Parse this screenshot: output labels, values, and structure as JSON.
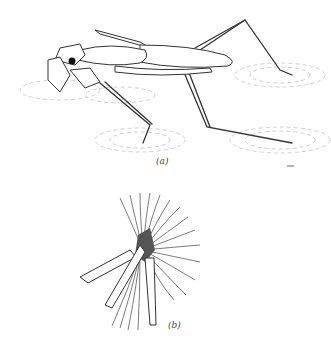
{
  "figure": {
    "panels": [
      {
        "label": "(a)",
        "subject": "water-strider-insect-on-water-surface"
      },
      {
        "label": "(b)",
        "subject": "fan-shaped-leg-swimming-hairs-detail"
      }
    ]
  },
  "colors": {
    "ink": "#3a3a3a",
    "ripple": "#bdbdbd",
    "background": "#ffffff"
  }
}
